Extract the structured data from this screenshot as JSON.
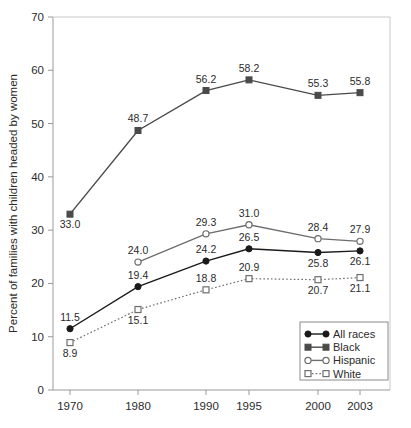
{
  "chart_data": {
    "type": "line",
    "title": "",
    "subtitle": "",
    "xlabel": "",
    "ylabel": "Percent of families with children headed by women",
    "categories": [
      "1970",
      "1980",
      "1990",
      "1995",
      "2000",
      "2003"
    ],
    "x": [
      1970,
      1980,
      1990,
      1995,
      2000,
      2003
    ],
    "xtick_labels": [
      "1970",
      "1980",
      "1990",
      "1995",
      "2000",
      "2003"
    ],
    "ytick_labels": [
      "0",
      "10",
      "20",
      "30",
      "40",
      "50",
      "60",
      "70"
    ],
    "ytick_values": [
      0,
      10,
      20,
      30,
      40,
      50,
      60,
      70
    ],
    "ylim": [
      0,
      70
    ],
    "grid": false,
    "legend_position": "bottom-right",
    "series": [
      {
        "name": "All races",
        "marker": "filled-circle",
        "line_style": "solid",
        "color": "#1a1a1a",
        "values": [
          11.5,
          19.4,
          24.2,
          26.5,
          25.8,
          26.1
        ],
        "labels": [
          "11.5",
          "19.4",
          "24.2",
          "26.5",
          "25.8",
          "26.1"
        ],
        "label_positions": [
          "above",
          "above",
          "above",
          "above",
          "below",
          "below"
        ]
      },
      {
        "name": "Black",
        "marker": "filled-square",
        "line_style": "solid",
        "color": "#4a4a4a",
        "values": [
          33.0,
          48.7,
          56.2,
          58.2,
          55.3,
          55.8
        ],
        "labels": [
          "33.0",
          "48.7",
          "56.2",
          "58.2",
          "55.3",
          "55.8"
        ],
        "label_positions": [
          "below",
          "above",
          "above",
          "above",
          "above",
          "above"
        ]
      },
      {
        "name": "Hispanic",
        "marker": "open-circle",
        "line_style": "solid",
        "color": "#6e6e6e",
        "values": [
          null,
          24.0,
          29.3,
          31.0,
          28.4,
          27.9
        ],
        "labels": [
          "",
          "24.0",
          "29.3",
          "31.0",
          "28.4",
          "27.9"
        ],
        "label_positions": [
          "above",
          "above",
          "above",
          "above",
          "above",
          "above"
        ]
      },
      {
        "name": "White",
        "marker": "open-square",
        "line_style": "dotted",
        "color": "#6e6e6e",
        "values": [
          8.9,
          15.1,
          18.8,
          20.9,
          20.7,
          21.1
        ],
        "labels": [
          "8.9",
          "15.1",
          "18.8",
          "20.9",
          "20.7",
          "21.1"
        ],
        "label_positions": [
          "below",
          "below",
          "above",
          "above",
          "below",
          "below"
        ]
      }
    ]
  },
  "legend": {
    "items": [
      {
        "label": "All races"
      },
      {
        "label": "Black"
      },
      {
        "label": "Hispanic"
      },
      {
        "label": "White"
      }
    ]
  }
}
